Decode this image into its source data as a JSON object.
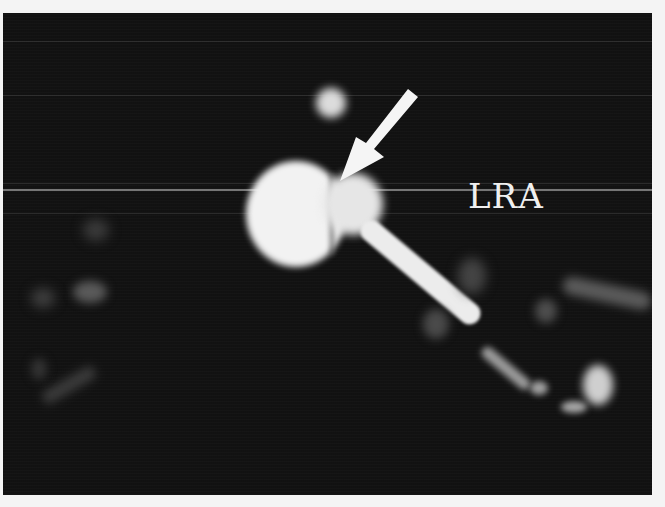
{
  "figure": {
    "type": "angiography-image",
    "background_color": "#121212",
    "page_color": "#f4f4f4",
    "annotations": {
      "label": "LRA",
      "arrow": "white-arrow pointing down-left at vessel neck"
    }
  }
}
